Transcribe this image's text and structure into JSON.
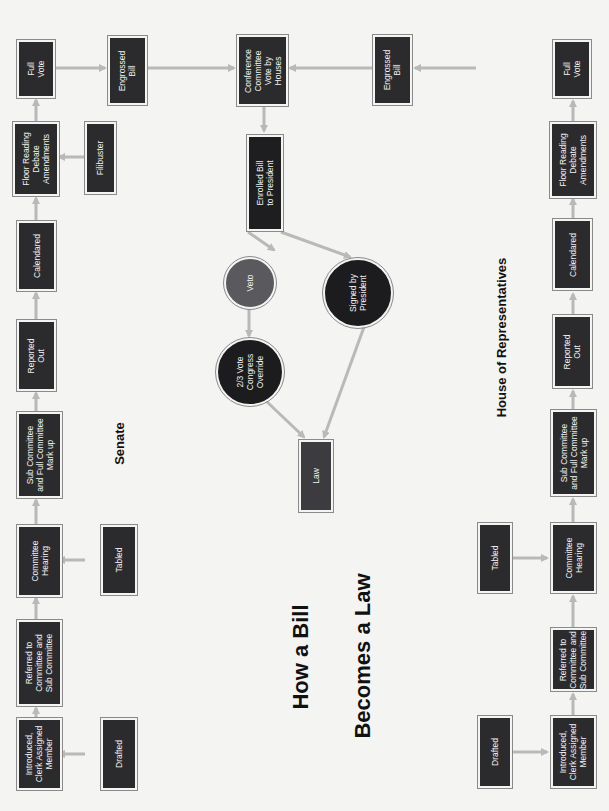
{
  "title": {
    "line1": "How a Bill",
    "line2": "Becomes a Law"
  },
  "sections": {
    "senate": "Senate",
    "house": "House of Representatives"
  },
  "senate": {
    "full_vote": "Full\nVote",
    "floor": "Floor Reading\nDebate\nAmendments",
    "filibuster": "Filibuster",
    "calendared": "Calendared",
    "reported_out": "Reported\nOut",
    "markup": "Sub Committee\nand Full Committee\nMark up",
    "hearing": "Committee\nHearing",
    "tabled": "Tabled",
    "referred": "Referred to\nCommittee and\nSub Committee",
    "introduced": "Introduced,\nClerk Assigned\nMember",
    "drafted": "Drafted",
    "engrossed": "Engrossed\nBill"
  },
  "house": {
    "full_vote": "Full\nVote",
    "floor": "Floor Reading\nDebate\nAmendments",
    "calendared": "Calendared",
    "reported_out": "Reported\nOut",
    "markup": "Sub Committee\nand Full Committee\nMark up",
    "hearing": "Committee\nHearing",
    "tabled": "Tabled",
    "referred": "Referred to\nCommittee and\nSub Committee",
    "introduced": "Introduced,\nClerk Assigned\nMember",
    "drafted": "Drafted",
    "engrossed": "Engrossed\nBill"
  },
  "center": {
    "conference": "Conference\nCommittee\nVote by\nHouses",
    "enrolled": "Enrolled Bill\nto President",
    "veto": "Veto",
    "override": "2/3 Vote\nCongress\nOverride",
    "signed": "Signed by\nPresident",
    "law": "Law"
  },
  "colors": {
    "box": "#2b2b2d",
    "veto": "#5a5a5e",
    "circle_dark": "#1c1c1e",
    "arrow": "#b9b9b9",
    "background": "#f4f4f3"
  }
}
